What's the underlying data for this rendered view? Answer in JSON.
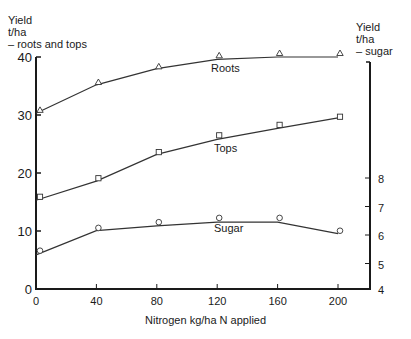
{
  "chart_data": {
    "type": "line",
    "title": "",
    "xlabel": "Nitrogen kg/ha N applied",
    "ylabel_left": [
      "Yield",
      "t/ha",
      "– roots and tops"
    ],
    "ylabel_right": [
      "Yield",
      "t/ha",
      "– sugar"
    ],
    "x": [
      0,
      40,
      80,
      120,
      160,
      200
    ],
    "x_ticks": [
      0,
      40,
      80,
      120,
      160,
      200
    ],
    "xlim": [
      0,
      220
    ],
    "y_left_ticks": [
      0,
      10,
      20,
      30,
      40
    ],
    "ylim_left": [
      0,
      40
    ],
    "y_right_ticks": [
      4,
      5,
      6,
      7,
      8
    ],
    "ylim_right": [
      4,
      8
    ],
    "grid": false,
    "legend": "inline labels",
    "series": [
      {
        "name": "Roots",
        "axis": "left",
        "marker": "triangle",
        "values": [
          30.8,
          35.6,
          38.3,
          40.2,
          40.6,
          40.6
        ],
        "fit": [
          30.3,
          35.2,
          38.0,
          39.6,
          40.0,
          40.0
        ]
      },
      {
        "name": "Tops",
        "axis": "left",
        "marker": "square",
        "values": [
          15.9,
          19.1,
          23.6,
          26.5,
          28.3,
          29.7
        ],
        "fit": [
          15.3,
          18.6,
          23.2,
          25.8,
          27.7,
          29.5
        ]
      },
      {
        "name": "Sugar",
        "axis": "right",
        "marker": "circle",
        "values": [
          5.45,
          6.25,
          6.45,
          6.6,
          6.6,
          6.15
        ],
        "fit": [
          5.3,
          6.15,
          6.32,
          6.45,
          6.45,
          6.05
        ]
      }
    ]
  }
}
